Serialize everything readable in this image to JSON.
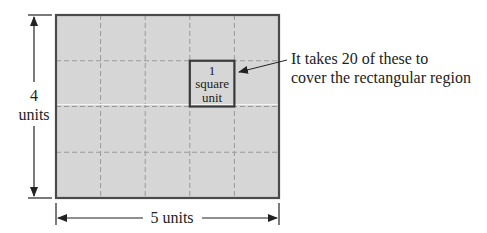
{
  "diagram": {
    "grid": {
      "columns": 5,
      "rows": 4
    },
    "colors": {
      "fill": "#d6d6d6",
      "border": "#4a4a4a",
      "grid": "#9a9a9a",
      "highlight_line": "#f4f4f4"
    },
    "height_label": {
      "value": "4",
      "unit": "units"
    },
    "width_label": "5 units",
    "unit_square": {
      "line1": "1",
      "line2": "square",
      "line3": "unit",
      "column_index": 3,
      "row_index": 1
    },
    "annotation": {
      "line1": "It takes 20 of these to",
      "line2": "cover the rectangular region"
    }
  }
}
